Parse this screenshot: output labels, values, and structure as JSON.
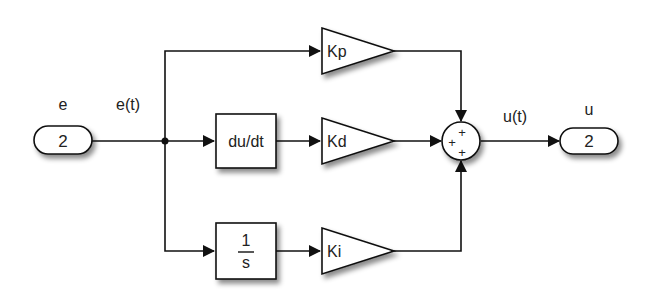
{
  "diagram": {
    "input_port": {
      "name": "e",
      "number": "2"
    },
    "input_signal": "e(t)",
    "output_port": {
      "name": "u",
      "number": "2"
    },
    "output_signal": "u(t)",
    "blocks": {
      "gain_p": "Kp",
      "gain_d": "Kd",
      "gain_i": "Ki",
      "derivative": "du/dt",
      "integrator_num": "1",
      "integrator_den": "s"
    },
    "sum_signs": [
      "+",
      "+",
      "+"
    ]
  }
}
